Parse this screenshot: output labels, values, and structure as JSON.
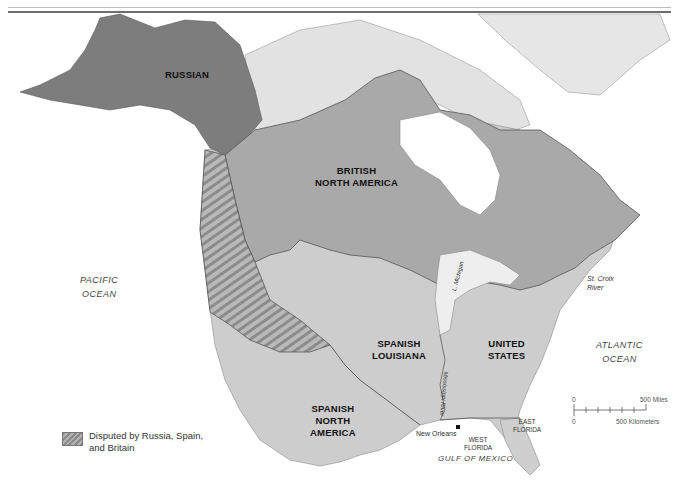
{
  "map": {
    "regions": [
      {
        "id": "russian",
        "label": "RUSSIAN"
      },
      {
        "id": "british",
        "label_lines": [
          "BRITISH",
          "NORTH AMERICA"
        ]
      },
      {
        "id": "spanish_louisiana",
        "label_lines": [
          "SPANISH",
          "LOUISIANA"
        ]
      },
      {
        "id": "united_states",
        "label_lines": [
          "UNITED",
          "STATES"
        ]
      },
      {
        "id": "spanish_na",
        "label_lines": [
          "SPANISH",
          "NORTH",
          "AMERICA"
        ]
      }
    ],
    "water": {
      "pacific": [
        "PACIFIC",
        "OCEAN"
      ],
      "atlantic": [
        "ATLANTIC",
        "OCEAN"
      ],
      "gulf": "GULF OF MEXICO"
    },
    "features": {
      "st_croix": [
        "St. Croix",
        "River"
      ],
      "lake_michigan": "L. Michigan",
      "mississippi": "Mississippi River",
      "new_orleans": "New Orleans",
      "west_florida": [
        "WEST",
        "FLORIDA"
      ],
      "east_florida": [
        "EAST",
        "FLORIDA"
      ]
    },
    "legend": {
      "disputed_line1": "Disputed by Russia, Spain,",
      "disputed_line2": "and Britain"
    },
    "scale": {
      "zero_top": "0",
      "miles": "500 Miles",
      "zero_bottom": "0",
      "km": "500 Kilometers"
    },
    "colors": {
      "russian": "#7d7d7d",
      "british": "#a9a9a9",
      "us_spanish": "#cdcdcd",
      "arctic": "#e2e2e2",
      "ocean": "#ffffff",
      "border": "#555555"
    }
  }
}
